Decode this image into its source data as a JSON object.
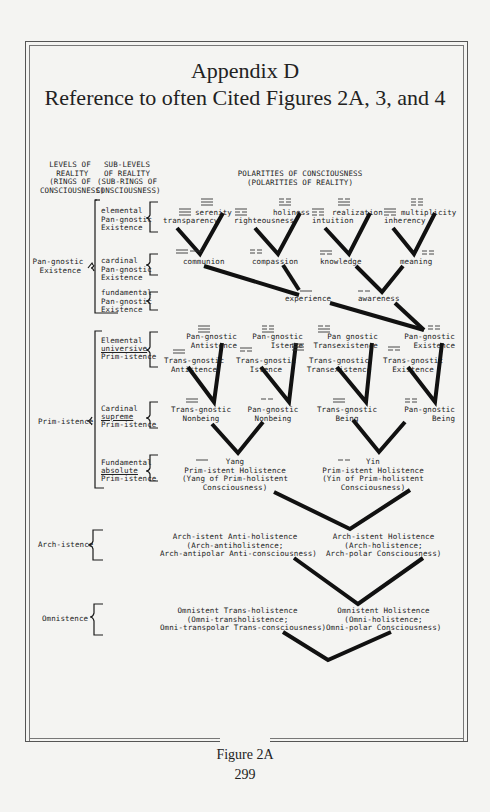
{
  "header": {
    "title": "Appendix D",
    "subtitle": "Reference to often Cited Figures 2A, 3, and 4"
  },
  "columns": {
    "levels": "LEVELS OF\n REALITY\n(RINGS OF\nCONSCIOUSNESS)",
    "sublevels": "SUB-LEVELS\nOF REALITY\n(SUB-RINGS OF\nCONSCIOUSNESS)",
    "polarities": "POLARITIES OF CONSCIOUSNESS\n(POLARITIES OF REALITY)"
  },
  "levels": {
    "pan_gnostic": "Pan-gnostic\n Existence",
    "prim_istence": "Prim-istence",
    "arch_istence": "Arch-istence",
    "omnistence": "Omnistence"
  },
  "sublevels": {
    "elemental_pg": "elemental\nPan-gnostic\nExistence",
    "cardinal_pg": "cardinal\nPan-gnostic\nExistence",
    "fundamental_pg": "fundamental\nPan-gnostic\nExistence",
    "elemental_pi_1": "Elemental",
    "elemental_pi_2": "universive",
    "elemental_pi_3": "Prim-istence",
    "cardinal_pi_1": "Cardinal",
    "cardinal_pi_2": "supreme",
    "cardinal_pi_3": "Prim-istence",
    "fundamental_pi_1": "Fundamental",
    "fundamental_pi_2": "absolute",
    "fundamental_pi_3": "Prim-istence"
  },
  "nodes": {
    "serenity": "serenity",
    "transparency": "transparency",
    "holiness": "holiness",
    "righteousness": "righteousness",
    "realization": "realization",
    "intuition": "intuition",
    "multiplicity": "multiplicity",
    "inherency": "inherency",
    "communion": "communion",
    "compassion": "compassion",
    "knowledge": "knowledge",
    "meaning": "meaning",
    "experience": "experience",
    "awareness": "awareness",
    "pg_antistence": "Pan-gnostic\nAntistence",
    "tg_antistence": "Trans-gnostic\nAntistence",
    "pg_istence": "Pan-gnostic\nIstence",
    "tg_istence": "Trans-gnostic\nIstence",
    "pg_transexistence": "Pan gnostic\nTransexistence",
    "tg_transexistence": "Trans-gnostic\nTransexistence",
    "pg_existence": "Pan-gnostic\nExistence",
    "tg_existence": "Trans-gnostic\nExistence",
    "tg_nonbeing": "Trans-gnostic\nNonbeing",
    "pg_nonbeing": "Pan-gnostic\nNonbeing",
    "tg_being": "Trans-gnostic\nBeing",
    "pg_being": "Pan-gnostic\nBeing",
    "yang": "Yang\nPrim-istent Holistence\n(Yang of Prim-holistent\nConsciousness)",
    "yin": "Yin\nPrim-istent Holistence\n(Yin of Prim-holistent\nConsciousness)",
    "arch_anti": "Arch-istent Anti-holistence\n(Arch-antiholistence;\nArch-antipolar Anti-consciousness)",
    "arch_hol": "Arch-istent Holistence\n(Arch-holistence;\nArch-polar Consciousness)",
    "omni_trans": "Omnistent Trans-holistence\n(Omni-transholistence;\nOmni-transpolar Trans-consciousness)",
    "omni_hol": "Omnistent Holistence\n(Omni-holistence;\nOmni-polar Consciousness)"
  },
  "footer": {
    "caption": "Figure 2A",
    "page_number": "299"
  }
}
